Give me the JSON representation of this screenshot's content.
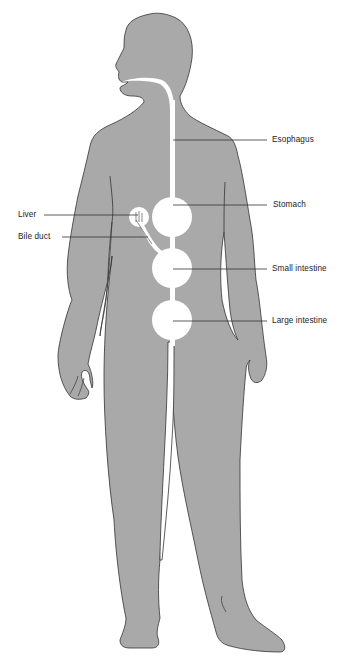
{
  "diagram": {
    "colors": {
      "body_fill": "#a9a9a9",
      "body_outline": "#333333",
      "organ_fill": "#ffffff",
      "label_text": "#222222",
      "background": "#ffffff"
    },
    "labels": [
      {
        "id": "esophagus",
        "text": "Esophagus",
        "side": "right"
      },
      {
        "id": "stomach",
        "text": "Stomach",
        "side": "right"
      },
      {
        "id": "liver",
        "text": "Liver",
        "side": "left"
      },
      {
        "id": "bile_duct",
        "text": "Bile duct",
        "side": "left"
      },
      {
        "id": "small_intestine",
        "text": "Small intestine",
        "side": "right"
      },
      {
        "id": "large_intestine",
        "text": "Large intestine",
        "side": "right"
      }
    ]
  }
}
